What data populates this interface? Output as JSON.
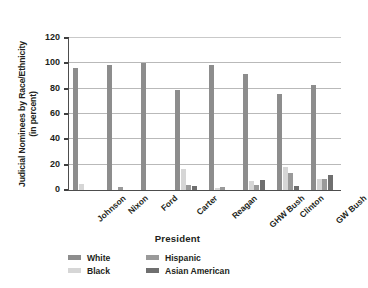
{
  "chart_data": {
    "type": "bar",
    "title": "",
    "xlabel": "President",
    "ylabel": "Judicial Nominees by Race/Ethnicity (in percent)",
    "ylabel_line1": "Judicial Nominees by Race/Ethnicity",
    "ylabel_line2": "(in percent)",
    "ylim": [
      0,
      120
    ],
    "yticks": [
      0,
      20,
      40,
      60,
      80,
      100,
      120
    ],
    "ytick_labels": [
      "0",
      "20",
      "40",
      "60",
      "80",
      "100",
      "120"
    ],
    "grid": true,
    "legend_position": "bottom",
    "categories": [
      "Johnson",
      "Nixon",
      "Ford",
      "Carter",
      "Reagan",
      "GHW Bush",
      "Clinton",
      "GW Bush"
    ],
    "series": [
      {
        "name": "White",
        "color": "#8d8d8d",
        "values": [
          96,
          98.5,
          100,
          79,
          99,
          91.5,
          76,
          83
        ]
      },
      {
        "name": "Black",
        "color": "#d6d6d6",
        "values": [
          4.5,
          0,
          0,
          16.5,
          1.5,
          6.8,
          18,
          8.5
        ]
      },
      {
        "name": "Hispanic",
        "color": "#9a9a9a",
        "values": [
          0,
          2.5,
          0,
          4,
          2,
          4,
          13.5,
          9
        ]
      },
      {
        "name": "Asian American",
        "color": "#6f6f6f",
        "values": [
          0,
          0,
          0,
          3,
          0,
          8,
          3.5,
          11.5
        ]
      }
    ]
  },
  "axis": {
    "x_title": "President",
    "y_title_line1": "Judicial Nominees by Race/Ethnicity",
    "y_title_line2": "(in percent)"
  },
  "legend": {
    "entries": [
      {
        "label": "White",
        "color": "#8d8d8d"
      },
      {
        "label": "Hispanic",
        "color": "#9a9a9a"
      },
      {
        "label": "Black",
        "color": "#d6d6d6"
      },
      {
        "label": "Asian American",
        "color": "#6f6f6f"
      }
    ]
  }
}
